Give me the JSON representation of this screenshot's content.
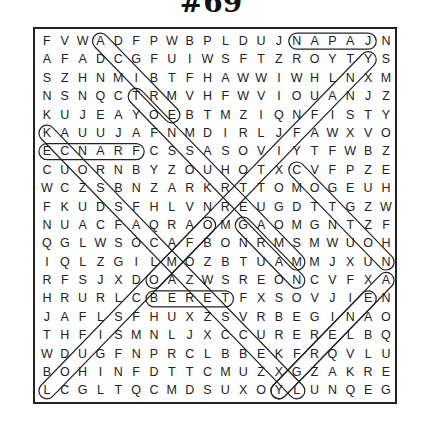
{
  "title": "#69",
  "grid": {
    "rows": 20,
    "cols": 20,
    "letters": [
      "FVWADFPWBPLDUJNAPAJN",
      "AFADCGFUIWSFTZROYTYS",
      "SZHNMIBTFHAWWIWHLNXM",
      "NSNQCTRMVHFWVIOUANJZ",
      "KUJEAYOEBTMZIQNFISTY",
      "KAUUJAFNMDIRLJFAWXVO",
      "ECNARFCSSASOVIYTFWBZ",
      "CUORNBYZOUHOTXCVFPZE",
      "WCZSBNZARKRTTOMOGEUH",
      "FKUDSFHLVNREUGDTTGZW",
      "NUACFAQRAOMGAOMGNTZF",
      "QGLWSOCAFBONRMSMWUOH",
      "IQLZGILMOZBTUAMMJXUN",
      "RFSJXDOAZWSREONCVFXA",
      "HRURLCBERETFXSOVJIEN",
      "JAFLSFHUXZSVRBEGINAO",
      "THFISMNLJXCCURERELBQ",
      "WDUGFNPRCLBBEKFRQVLU",
      "BOHINFDTTCMUZXGZAKRE",
      "LCGLTQCMDSUXOYLUNQEG"
    ]
  },
  "found_words": [
    {
      "word": "JAPAN",
      "start": [
        0,
        18
      ],
      "end": [
        0,
        14
      ]
    },
    {
      "word": "FRANCE",
      "start": [
        6,
        5
      ],
      "end": [
        6,
        0
      ]
    },
    {
      "word": "BERET",
      "start": [
        14,
        6
      ],
      "end": [
        14,
        10
      ]
    },
    {
      "word": "ADCGIBTRMV-diag",
      "start": [
        0,
        3
      ],
      "end": [
        4,
        7
      ]
    },
    {
      "word": "TR-diag",
      "start": [
        3,
        5
      ],
      "end": [
        12,
        14
      ]
    },
    {
      "word": "KA-diag",
      "start": [
        5,
        0
      ],
      "end": [
        19,
        14
      ]
    },
    {
      "word": "Y-diag",
      "start": [
        1,
        18
      ],
      "end": [
        13,
        6
      ]
    },
    {
      "word": "L-diag",
      "start": [
        19,
        0
      ],
      "end": [
        10,
        9
      ]
    },
    {
      "word": "C-diag",
      "start": [
        7,
        14
      ],
      "end": [
        12,
        19
      ]
    },
    {
      "word": "G-diag",
      "start": [
        10,
        11
      ],
      "end": [
        13,
        14
      ]
    },
    {
      "word": "E-diag",
      "start": [
        14,
        18
      ],
      "end": [
        19,
        13
      ]
    },
    {
      "word": "Y-diag2",
      "start": [
        19,
        13
      ],
      "end": [
        13,
        19
      ]
    }
  ],
  "colors": {
    "ink": "#222222",
    "background": "#ffffff"
  }
}
